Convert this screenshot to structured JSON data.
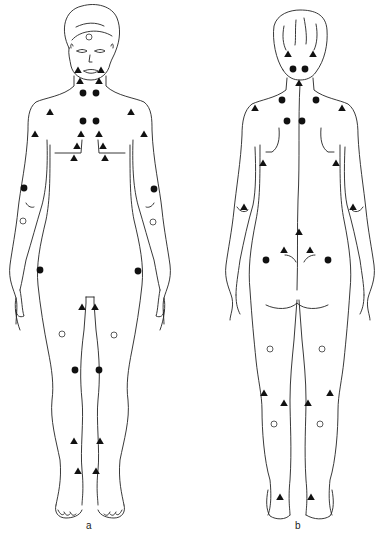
{
  "figure": {
    "panels": [
      {
        "id": "a",
        "label": "a",
        "view": "anterior"
      },
      {
        "id": "b",
        "label": "b",
        "view": "posterior"
      }
    ],
    "marker_types": {
      "filled_circle": "filled-circle",
      "open_circle": "open-circle",
      "triangle": "filled-triangle"
    },
    "markers": {
      "a": {
        "filled_circle": [
          [
            83,
            93
          ],
          [
            96,
            93
          ],
          [
            83,
            121
          ],
          [
            96,
            121
          ],
          [
            24,
            188
          ],
          [
            154,
            189
          ],
          [
            40,
            270
          ],
          [
            138,
            271
          ],
          [
            75,
            370
          ],
          [
            99,
            370
          ]
        ],
        "open_circle": [
          [
            89,
            37
          ],
          [
            23,
            221
          ],
          [
            153,
            222
          ],
          [
            62,
            334
          ],
          [
            114,
            335
          ]
        ],
        "triangle": [
          [
            78,
            70
          ],
          [
            101,
            70
          ],
          [
            80,
            81
          ],
          [
            99,
            81
          ],
          [
            50,
            112
          ],
          [
            131,
            112
          ],
          [
            35,
            134
          ],
          [
            144,
            134
          ],
          [
            81,
            134
          ],
          [
            99,
            134
          ],
          [
            77,
            146
          ],
          [
            103,
            146
          ],
          [
            74,
            158
          ],
          [
            105,
            158
          ],
          [
            82,
            307
          ],
          [
            95,
            307
          ],
          [
            74,
            441
          ],
          [
            100,
            441
          ],
          [
            78,
            471
          ],
          [
            96,
            471
          ]
        ]
      },
      "b": {
        "filled_circle": [
          [
            293,
            69
          ],
          [
            305,
            69
          ],
          [
            282,
            100
          ],
          [
            316,
            100
          ],
          [
            287,
            121
          ],
          [
            302,
            121
          ],
          [
            266,
            260
          ],
          [
            328,
            260
          ]
        ],
        "open_circle": [
          [
            270,
            349
          ],
          [
            322,
            349
          ],
          [
            274,
            424
          ],
          [
            320,
            424
          ]
        ],
        "triangle": [
          [
            288,
            54
          ],
          [
            313,
            54
          ],
          [
            299,
            83
          ],
          [
            255,
            108
          ],
          [
            342,
            108
          ],
          [
            263,
            163
          ],
          [
            336,
            163
          ],
          [
            244,
            207
          ],
          [
            353,
            207
          ],
          [
            299,
            232
          ],
          [
            284,
            250
          ],
          [
            310,
            250
          ],
          [
            264,
            393
          ],
          [
            330,
            393
          ],
          [
            284,
            403
          ],
          [
            308,
            403
          ],
          [
            280,
            497
          ],
          [
            311,
            497
          ]
        ]
      }
    }
  }
}
